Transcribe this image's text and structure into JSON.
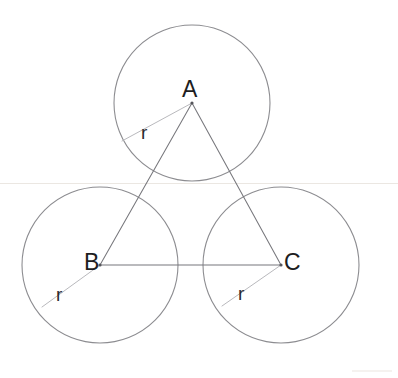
{
  "figure": {
    "background_color": "#ffffff",
    "width": 398,
    "height": 378,
    "circle_stroke_color": "#8c8c90",
    "triangle_stroke_color": "#77777c",
    "radius_stroke_color": "#b9b9bd",
    "guide_stroke_color": "#ebe7e2",
    "label_color": "#1d1d21"
  },
  "circles": [
    {
      "id": "circle-a",
      "center_label": "A",
      "cx": 192,
      "cy": 103,
      "r": 78,
      "radius_label": "r",
      "radius_label_x": 141,
      "radius_label_y": 123,
      "radius_end_x": 122,
      "radius_end_y": 141
    },
    {
      "id": "circle-b",
      "center_label": "B",
      "cx": 100,
      "cy": 265,
      "r": 78,
      "radius_label": "r",
      "radius_label_x": 56,
      "radius_label_y": 285,
      "radius_end_x": 42,
      "radius_end_y": 307
    },
    {
      "id": "circle-c",
      "center_label": "C",
      "cx": 281,
      "cy": 265,
      "r": 78,
      "radius_label": "r",
      "radius_label_x": 238,
      "radius_label_y": 284,
      "radius_end_x": 222,
      "radius_end_y": 306
    }
  ],
  "vertex_labels": [
    {
      "text": "A",
      "x": 182,
      "y": 78
    },
    {
      "text": "B",
      "x": 84,
      "y": 251
    },
    {
      "text": "C",
      "x": 284,
      "y": 251
    }
  ],
  "triangle": {
    "id": "triangle-abc",
    "vertices": [
      {
        "label": "A",
        "x": 192,
        "y": 103
      },
      {
        "label": "B",
        "x": 100,
        "y": 265
      },
      {
        "label": "C",
        "x": 281,
        "y": 265
      }
    ],
    "edges": [
      "A-B",
      "B-C",
      "C-A"
    ]
  },
  "guides": [
    {
      "id": "horizontal-tangent-line",
      "x1": 0,
      "y1": 183.5,
      "x2": 398,
      "y2": 183.5
    }
  ]
}
